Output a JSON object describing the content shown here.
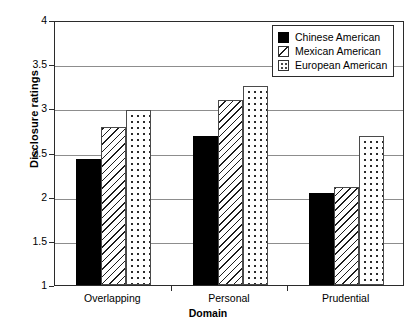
{
  "chart_data": {
    "type": "bar",
    "title": "",
    "xlabel": "Domain",
    "ylabel": "Disclosure ratings",
    "categories": [
      "Overlapping",
      "Personal",
      "Prudential"
    ],
    "series": [
      {
        "name": "Chinese American",
        "pattern": "solid",
        "values": [
          2.43,
          2.69,
          2.04
        ]
      },
      {
        "name": "Mexican American",
        "pattern": "hatch",
        "values": [
          2.79,
          3.1,
          2.11
        ]
      },
      {
        "name": "European American",
        "pattern": "dots",
        "values": [
          2.98,
          3.25,
          2.69
        ]
      }
    ],
    "ylim": [
      1,
      4
    ],
    "ytick_labels": [
      "1",
      "1.5",
      "2",
      "2.5",
      "3",
      "3.5",
      "4"
    ],
    "ytick_values": [
      1,
      1.5,
      2,
      2.5,
      3,
      3.5,
      4
    ],
    "grid": true,
    "legend_position": "upper-right",
    "colors": {
      "axis": "#2b2b2b",
      "gridline": "#8d8d8d",
      "bar_solid": "#000000",
      "bar_outline": "#4a4a4a",
      "background": "#ffffff"
    }
  }
}
